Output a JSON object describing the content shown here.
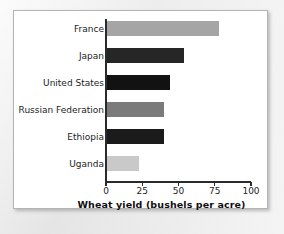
{
  "chart_data": {
    "type": "bar",
    "orientation": "horizontal",
    "title": "",
    "xlabel": "Wheat yield (bushels per acre)",
    "ylabel": "",
    "xlim": [
      0,
      100
    ],
    "xticks": [
      0,
      25,
      50,
      75,
      100
    ],
    "xtick_labels": [
      "0",
      "25",
      "50",
      "75",
      "100"
    ],
    "grid": false,
    "legend": false,
    "categories": [
      "France",
      "Japan",
      "United States",
      "Russian Federation",
      "Ethiopia",
      "Uganda"
    ],
    "values": [
      78,
      54,
      44,
      40,
      40,
      23
    ],
    "bar_colors": [
      "#a5a5a5",
      "#262626",
      "#121212",
      "#7b7b7b",
      "#1b1b1b",
      "#c9c9c9"
    ],
    "bars": [
      {
        "category": "France",
        "value": 78,
        "color": "#a5a5a5"
      },
      {
        "category": "Japan",
        "value": 54,
        "color": "#262626"
      },
      {
        "category": "United States",
        "value": 44,
        "color": "#121212"
      },
      {
        "category": "Russian Federation",
        "value": 40,
        "color": "#7b7b7b"
      },
      {
        "category": "Ethiopia",
        "value": 40,
        "color": "#1b1b1b"
      },
      {
        "category": "Uganda",
        "value": 23,
        "color": "#c9c9c9"
      }
    ]
  },
  "figure": {
    "background_color": "#ffffff",
    "border_color": "#b4b4b4",
    "axis_color": "#2b2b2b",
    "text_color": "#1c1c1c"
  }
}
